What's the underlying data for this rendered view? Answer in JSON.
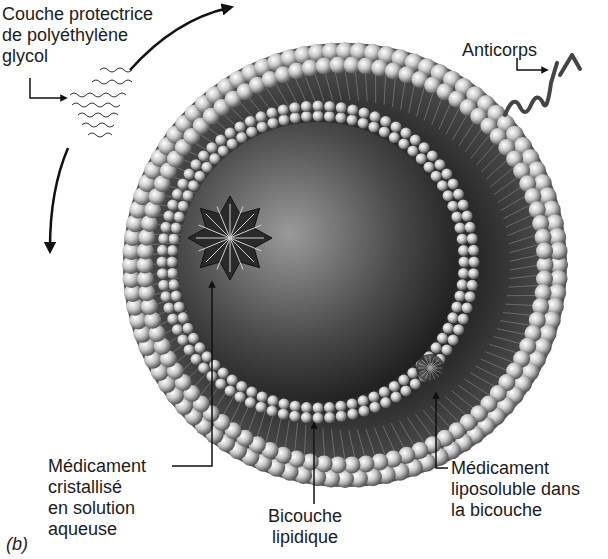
{
  "figure": {
    "panel_label": "(b)",
    "colors": {
      "background": "#ffffff",
      "text": "#1c1c1c",
      "core_light": "#8a8a8a",
      "core_dark": "#1a1a1a",
      "head_light": "#f2f2f2",
      "head_dark": "#6a6a6a"
    }
  },
  "labels": {
    "peg_coating": [
      "Couche protectrice",
      "de polyéthylène",
      "glycol"
    ],
    "antibody": [
      "Anticorps"
    ],
    "crystal_drug": [
      "Médicament",
      "cristallisé",
      "en solution",
      "aqueuse"
    ],
    "bilayer": [
      "Bicouche",
      "lipidique"
    ],
    "lipo_drug": [
      "Médicament",
      "liposoluble dans",
      "la bicouche"
    ]
  }
}
